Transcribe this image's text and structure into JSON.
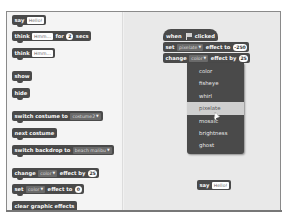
{
  "palette": {
    "blocks": [
      {
        "id": "say",
        "parts": [
          "say"
        ],
        "input": "Hello!"
      },
      {
        "id": "think-for-secs",
        "parts": [
          "think",
          "for",
          "secs"
        ],
        "input": "Hmm...",
        "number": "2"
      },
      {
        "id": "think",
        "parts": [
          "think"
        ],
        "input": "Hmm..."
      },
      {
        "id": "show",
        "label": "show"
      },
      {
        "id": "hide",
        "label": "hide"
      },
      {
        "id": "switch-costume",
        "label": "switch costume to",
        "dropdown": "costume2"
      },
      {
        "id": "next-costume",
        "label": "next costume"
      },
      {
        "id": "switch-backdrop",
        "label": "switch backdrop to",
        "dropdown": "beach malibu"
      },
      {
        "id": "change-effect",
        "parts": [
          "change",
          "effect by"
        ],
        "dropdown": "color",
        "number": "25"
      },
      {
        "id": "set-effect",
        "parts": [
          "set",
          "effect to"
        ],
        "dropdown": "color",
        "number": "0"
      },
      {
        "id": "clear-effects",
        "label": "clear graphic effects"
      }
    ]
  },
  "scripts": {
    "hat": {
      "parts": [
        "when",
        "clicked"
      ],
      "icon": "green-flag-icon"
    },
    "set_effect": {
      "parts": [
        "set",
        "effect to"
      ],
      "dropdown": "pixelate",
      "number": "-250"
    },
    "change_effect": {
      "parts": [
        "change",
        "effect by"
      ],
      "dropdown": "color",
      "number": "25"
    },
    "loose_say": {
      "label": "say",
      "input": "Hello!"
    }
  },
  "effect_menu": {
    "items": [
      "color",
      "fisheye",
      "whirl",
      "pixelate",
      "mosaic",
      "brightness",
      "ghost"
    ],
    "highlighted": "pixelate"
  },
  "arrow_glyph": "▼"
}
